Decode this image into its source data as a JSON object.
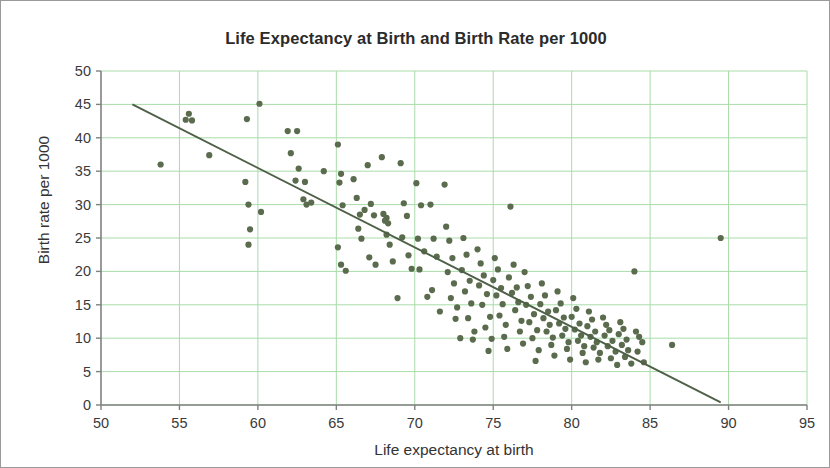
{
  "chart_data": {
    "type": "scatter",
    "title": "Life Expectancy at Birth and Birth Rate per 1000",
    "xlabel": "Life expectancy at birth",
    "ylabel": "Birth rate per 1000",
    "xlim": [
      50,
      95
    ],
    "ylim": [
      0,
      50
    ],
    "xticks": [
      50,
      55,
      60,
      65,
      70,
      75,
      80,
      85,
      90,
      95
    ],
    "yticks": [
      0,
      5,
      10,
      15,
      20,
      25,
      30,
      35,
      40,
      45,
      50
    ],
    "grid": true,
    "legend": "none",
    "colors": {
      "point": "#5a6b4e",
      "grid": "#a9dca9",
      "axis": "#808080",
      "trendline": "#4e6047",
      "border": "#9a9a9a",
      "title": "#2b2b2b"
    },
    "point_radius": 3.1,
    "trendline": {
      "type": "linear",
      "x_start": 52.0,
      "y_start": 45.0,
      "x_end": 89.5,
      "y_end": 0.4
    },
    "points": [
      [
        53.8,
        36.0
      ],
      [
        55.6,
        43.6
      ],
      [
        55.8,
        42.6
      ],
      [
        55.4,
        42.7
      ],
      [
        56.9,
        37.4
      ],
      [
        59.2,
        33.4
      ],
      [
        59.3,
        42.8
      ],
      [
        59.4,
        30.0
      ],
      [
        59.5,
        26.3
      ],
      [
        59.4,
        24.0
      ],
      [
        60.1,
        45.1
      ],
      [
        60.2,
        28.9
      ],
      [
        61.9,
        41.0
      ],
      [
        62.5,
        41.0
      ],
      [
        62.1,
        37.7
      ],
      [
        62.6,
        35.4
      ],
      [
        62.4,
        33.6
      ],
      [
        63.0,
        33.4
      ],
      [
        62.9,
        30.8
      ],
      [
        63.1,
        30.0
      ],
      [
        63.4,
        30.3
      ],
      [
        64.2,
        35.0
      ],
      [
        65.1,
        39.0
      ],
      [
        65.3,
        34.6
      ],
      [
        65.2,
        33.3
      ],
      [
        65.4,
        29.9
      ],
      [
        65.1,
        23.6
      ],
      [
        65.3,
        21.0
      ],
      [
        65.6,
        20.1
      ],
      [
        66.1,
        33.8
      ],
      [
        66.3,
        31.0
      ],
      [
        66.5,
        28.5
      ],
      [
        66.4,
        26.4
      ],
      [
        66.6,
        24.9
      ],
      [
        66.8,
        29.2
      ],
      [
        67.0,
        35.9
      ],
      [
        67.2,
        30.1
      ],
      [
        67.4,
        28.4
      ],
      [
        67.1,
        22.1
      ],
      [
        67.5,
        21.0
      ],
      [
        67.9,
        37.1
      ],
      [
        68.0,
        28.6
      ],
      [
        68.2,
        28.0
      ],
      [
        68.1,
        27.6
      ],
      [
        68.3,
        27.2
      ],
      [
        68.2,
        25.5
      ],
      [
        68.4,
        24.0
      ],
      [
        68.6,
        21.5
      ],
      [
        68.9,
        16.0
      ],
      [
        69.1,
        36.2
      ],
      [
        69.3,
        30.2
      ],
      [
        69.5,
        28.3
      ],
      [
        69.2,
        25.1
      ],
      [
        69.6,
        22.4
      ],
      [
        69.8,
        20.4
      ],
      [
        70.1,
        33.2
      ],
      [
        70.4,
        29.9
      ],
      [
        70.2,
        24.9
      ],
      [
        70.6,
        23.0
      ],
      [
        70.3,
        20.3
      ],
      [
        70.8,
        16.2
      ],
      [
        71.0,
        30.0
      ],
      [
        71.2,
        24.9
      ],
      [
        71.4,
        22.2
      ],
      [
        71.1,
        17.2
      ],
      [
        71.6,
        14.0
      ],
      [
        71.9,
        33.0
      ],
      [
        72.0,
        26.7
      ],
      [
        72.2,
        24.6
      ],
      [
        72.4,
        22.0
      ],
      [
        72.1,
        19.9
      ],
      [
        72.5,
        18.2
      ],
      [
        72.3,
        16.0
      ],
      [
        72.7,
        14.6
      ],
      [
        72.6,
        12.9
      ],
      [
        72.9,
        10.0
      ],
      [
        73.1,
        25.0
      ],
      [
        73.3,
        22.5
      ],
      [
        73.0,
        20.2
      ],
      [
        73.5,
        18.6
      ],
      [
        73.2,
        17.0
      ],
      [
        73.6,
        15.2
      ],
      [
        73.4,
        13.0
      ],
      [
        73.8,
        11.0
      ],
      [
        73.7,
        9.8
      ],
      [
        74.0,
        23.3
      ],
      [
        74.2,
        21.2
      ],
      [
        74.4,
        19.4
      ],
      [
        74.1,
        17.9
      ],
      [
        74.6,
        16.6
      ],
      [
        74.3,
        15.0
      ],
      [
        74.8,
        13.2
      ],
      [
        74.5,
        11.6
      ],
      [
        74.9,
        9.9
      ],
      [
        74.7,
        8.1
      ],
      [
        75.1,
        22.0
      ],
      [
        75.3,
        20.3
      ],
      [
        75.0,
        18.7
      ],
      [
        75.5,
        17.5
      ],
      [
        75.2,
        16.4
      ],
      [
        75.6,
        15.1
      ],
      [
        75.4,
        13.4
      ],
      [
        75.8,
        12.0
      ],
      [
        75.7,
        10.2
      ],
      [
        75.9,
        8.4
      ],
      [
        76.1,
        29.7
      ],
      [
        76.3,
        21.0
      ],
      [
        76.0,
        19.1
      ],
      [
        76.5,
        17.6
      ],
      [
        76.2,
        16.8
      ],
      [
        76.6,
        15.4
      ],
      [
        76.4,
        14.2
      ],
      [
        76.8,
        12.6
      ],
      [
        76.7,
        11.0
      ],
      [
        76.9,
        9.2
      ],
      [
        77.0,
        19.9
      ],
      [
        77.2,
        17.8
      ],
      [
        77.4,
        16.2
      ],
      [
        77.1,
        15.0
      ],
      [
        77.6,
        13.6
      ],
      [
        77.3,
        12.4
      ],
      [
        77.8,
        11.2
      ],
      [
        77.5,
        10.0
      ],
      [
        77.9,
        8.2
      ],
      [
        77.7,
        6.6
      ],
      [
        78.1,
        18.2
      ],
      [
        78.3,
        16.4
      ],
      [
        78.0,
        15.1
      ],
      [
        78.5,
        14.0
      ],
      [
        78.2,
        13.0
      ],
      [
        78.6,
        12.0
      ],
      [
        78.4,
        11.0
      ],
      [
        78.8,
        10.1
      ],
      [
        78.7,
        9.0
      ],
      [
        78.9,
        7.4
      ],
      [
        79.1,
        17.0
      ],
      [
        79.3,
        15.2
      ],
      [
        79.0,
        14.2
      ],
      [
        79.5,
        13.1
      ],
      [
        79.2,
        12.2
      ],
      [
        79.6,
        11.4
      ],
      [
        79.4,
        10.4
      ],
      [
        79.8,
        9.4
      ],
      [
        79.7,
        8.4
      ],
      [
        79.9,
        6.8
      ],
      [
        80.1,
        16.0
      ],
      [
        80.3,
        14.4
      ],
      [
        80.0,
        13.2
      ],
      [
        80.5,
        12.2
      ],
      [
        80.2,
        11.3
      ],
      [
        80.6,
        10.4
      ],
      [
        80.4,
        9.6
      ],
      [
        80.8,
        8.8
      ],
      [
        80.7,
        7.8
      ],
      [
        80.9,
        6.4
      ],
      [
        81.1,
        14.0
      ],
      [
        81.3,
        12.8
      ],
      [
        81.0,
        11.8
      ],
      [
        81.5,
        11.0
      ],
      [
        81.2,
        10.2
      ],
      [
        81.6,
        9.4
      ],
      [
        81.4,
        8.6
      ],
      [
        81.8,
        7.8
      ],
      [
        81.7,
        6.8
      ],
      [
        82.0,
        13.1
      ],
      [
        82.2,
        12.0
      ],
      [
        82.4,
        11.2
      ],
      [
        82.1,
        10.4
      ],
      [
        82.6,
        9.6
      ],
      [
        82.3,
        8.8
      ],
      [
        82.8,
        8.0
      ],
      [
        82.5,
        7.0
      ],
      [
        82.9,
        6.0
      ],
      [
        83.1,
        12.4
      ],
      [
        83.3,
        11.4
      ],
      [
        83.0,
        10.6
      ],
      [
        83.5,
        9.8
      ],
      [
        83.2,
        9.0
      ],
      [
        83.6,
        8.2
      ],
      [
        83.4,
        7.2
      ],
      [
        83.8,
        6.2
      ],
      [
        84.0,
        20.0
      ],
      [
        84.1,
        11.0
      ],
      [
        84.3,
        10.2
      ],
      [
        84.5,
        9.4
      ],
      [
        84.2,
        8.0
      ],
      [
        84.6,
        6.4
      ],
      [
        86.4,
        9.0
      ],
      [
        89.5,
        25.0
      ]
    ]
  }
}
